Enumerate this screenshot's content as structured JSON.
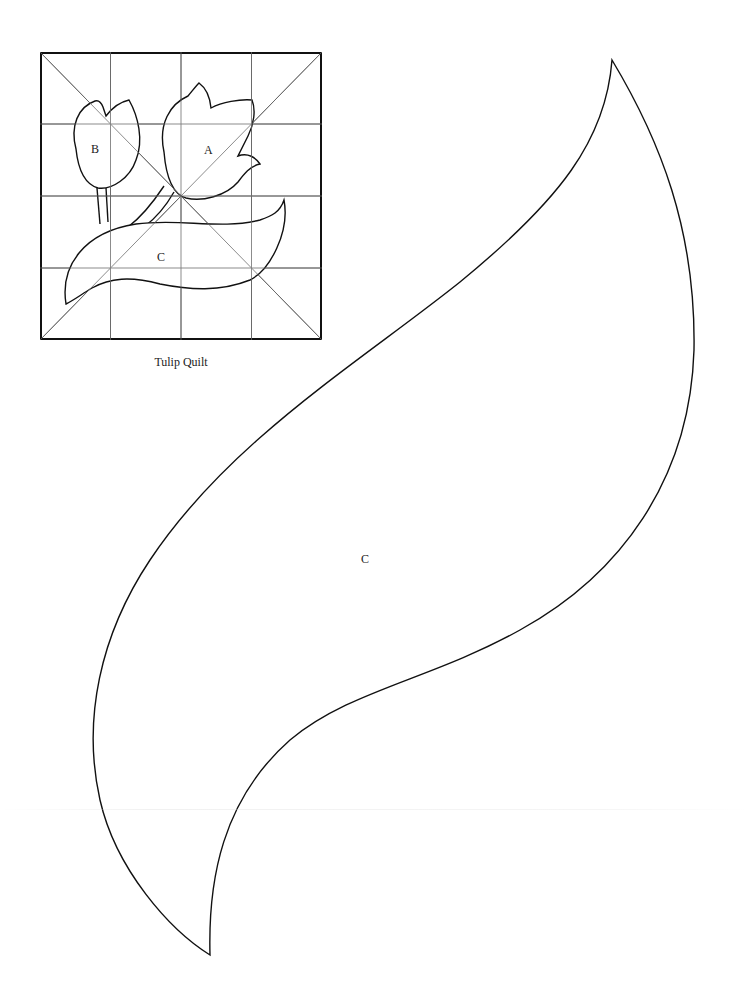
{
  "page": {
    "type": "quilt pattern template sheet",
    "background": "#ffffff",
    "line_color": "#111111",
    "grid_color": "#666666"
  },
  "thumbnail": {
    "caption": "Tulip Quilt",
    "grid": "4x4 with diagonals",
    "labels": {
      "a": "A",
      "b": "B",
      "c": "C"
    }
  },
  "template": {
    "piece_label": "C",
    "shape": "leaf"
  }
}
